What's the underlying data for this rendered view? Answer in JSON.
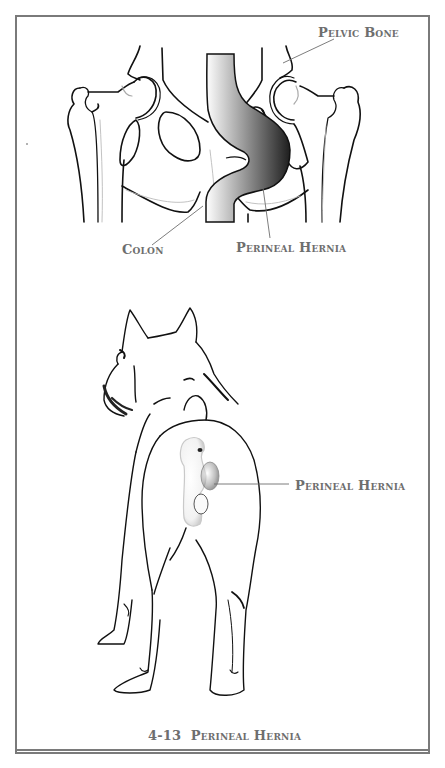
{
  "figure": {
    "number": "4-13",
    "title": "Perineal Hernia",
    "border_color": "#7a7a7a",
    "label_color": "#6e6e6e"
  },
  "top_panel": {
    "description": "Rear view of canine pelvis showing colon deviating into a perineal hernia",
    "labels": {
      "pelvic_bone": "Pelvic Bone",
      "colon": "Colon",
      "perineal_hernia": "Perineal Hernia"
    }
  },
  "bottom_panel": {
    "description": "Rear view of a standing dog with a swelling beside the anus",
    "labels": {
      "perineal_hernia": "Perineal Hernia"
    }
  }
}
